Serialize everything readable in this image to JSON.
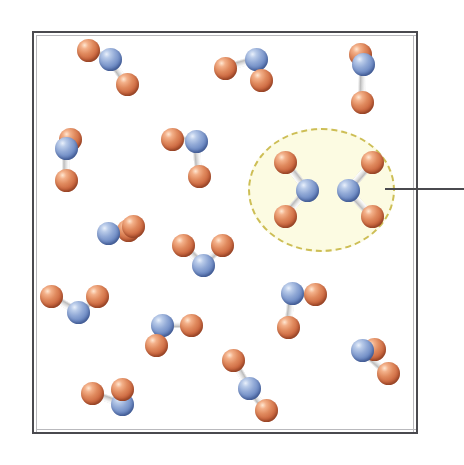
{
  "figure": {
    "kind": "molecular-diagram",
    "caption": "",
    "width": 464,
    "height": 465
  },
  "colors": {
    "background": "#ffffff",
    "container_border": "#4a4a4f",
    "container_border_shadow": "#b9b9bd",
    "container_fill": "#ffffff",
    "highlight_fill": "#fcfbe2",
    "highlight_dash": "#cdbe55",
    "callout_line": "#4a4a4f",
    "oxygen_atom": "#cd6a42",
    "nitrogen_atom": "#6e8bc4",
    "bond": "#d8d8d8"
  },
  "container": {
    "label": "gas-container",
    "x": 32,
    "y": 31,
    "width": 386,
    "height": 403,
    "border_width": 2
  },
  "highlight": {
    "label": "highlighted-collision-pair",
    "x": 248,
    "y": 128,
    "width": 147,
    "height": 124,
    "dash_width": 2
  },
  "callout": {
    "label": "callout-leader-line",
    "x": 385,
    "y": 188,
    "length": 79,
    "thickness": 2
  },
  "atom_legend": [
    {
      "element": "N",
      "name": "nitrogen",
      "color": "#6e8bc4",
      "radius": 11
    },
    {
      "element": "O",
      "name": "oxygen",
      "color": "#cd6a42",
      "radius": 11
    }
  ],
  "molecules": [
    {
      "name": "NO2",
      "id": "molecule-1",
      "region": "free-gas",
      "n": {
        "x": 110,
        "y": 59,
        "r": 11.5
      },
      "o": [
        {
          "x": 88,
          "y": 50,
          "r": 11.5
        },
        {
          "x": 127,
          "y": 84,
          "r": 11.5
        }
      ]
    },
    {
      "name": "NO2",
      "id": "molecule-2",
      "region": "free-gas",
      "n": {
        "x": 256,
        "y": 59,
        "r": 11.5
      },
      "o": [
        {
          "x": 225,
          "y": 68,
          "r": 11.5
        },
        {
          "x": 261,
          "y": 80,
          "r": 11.5
        }
      ]
    },
    {
      "name": "NO2",
      "id": "molecule-3",
      "region": "free-gas",
      "n": {
        "x": 363,
        "y": 64,
        "r": 11.5
      },
      "o": [
        {
          "x": 360,
          "y": 54,
          "r": 11.5
        },
        {
          "x": 362,
          "y": 102,
          "r": 11.5
        }
      ]
    },
    {
      "name": "NO2",
      "id": "molecule-4",
      "region": "free-gas",
      "n": {
        "x": 66,
        "y": 148,
        "r": 11.5
      },
      "o": [
        {
          "x": 70,
          "y": 139,
          "r": 11.5
        },
        {
          "x": 66,
          "y": 180,
          "r": 11.5
        }
      ]
    },
    {
      "name": "NO2",
      "id": "molecule-5",
      "region": "free-gas",
      "n": {
        "x": 196,
        "y": 141,
        "r": 11.5
      },
      "o": [
        {
          "x": 172,
          "y": 139,
          "r": 11.5
        },
        {
          "x": 199,
          "y": 176,
          "r": 11.5
        }
      ]
    },
    {
      "name": "NO2",
      "id": "molecule-6",
      "region": "highlighted",
      "n": {
        "x": 307,
        "y": 190,
        "r": 11.5
      },
      "o": [
        {
          "x": 285,
          "y": 162,
          "r": 11.5
        },
        {
          "x": 285,
          "y": 216,
          "r": 11.5
        }
      ]
    },
    {
      "name": "NO2",
      "id": "molecule-7",
      "region": "highlighted",
      "n": {
        "x": 348,
        "y": 190,
        "r": 11.5
      },
      "o": [
        {
          "x": 372,
          "y": 162,
          "r": 11.5
        },
        {
          "x": 372,
          "y": 216,
          "r": 11.5
        }
      ]
    },
    {
      "name": "NO2",
      "id": "molecule-8",
      "region": "free-gas",
      "n": {
        "x": 108,
        "y": 233,
        "r": 11.5
      },
      "o": [
        {
          "x": 128,
          "y": 230,
          "r": 11.5
        },
        {
          "x": 133,
          "y": 226,
          "r": 11.5
        }
      ]
    },
    {
      "name": "NO2",
      "id": "molecule-9",
      "region": "free-gas",
      "n": {
        "x": 203,
        "y": 265,
        "r": 11.5
      },
      "o": [
        {
          "x": 183,
          "y": 245,
          "r": 11.5
        },
        {
          "x": 222,
          "y": 245,
          "r": 11.5
        }
      ]
    },
    {
      "name": "NO2",
      "id": "molecule-10",
      "region": "free-gas",
      "n": {
        "x": 78,
        "y": 312,
        "r": 11.5
      },
      "o": [
        {
          "x": 51,
          "y": 296,
          "r": 11.5
        },
        {
          "x": 97,
          "y": 296,
          "r": 11.5
        }
      ]
    },
    {
      "name": "NO2",
      "id": "molecule-11",
      "region": "free-gas",
      "n": {
        "x": 162,
        "y": 325,
        "r": 11.5
      },
      "o": [
        {
          "x": 191,
          "y": 325,
          "r": 11.5
        },
        {
          "x": 156,
          "y": 345,
          "r": 11.5
        }
      ]
    },
    {
      "name": "NO2",
      "id": "molecule-12",
      "region": "free-gas",
      "n": {
        "x": 292,
        "y": 293,
        "r": 11.5
      },
      "o": [
        {
          "x": 315,
          "y": 294,
          "r": 11.5
        },
        {
          "x": 288,
          "y": 327,
          "r": 11.5
        }
      ]
    },
    {
      "name": "NO2",
      "id": "molecule-13",
      "region": "free-gas",
      "n": {
        "x": 362,
        "y": 350,
        "r": 11.5
      },
      "o": [
        {
          "x": 374,
          "y": 349,
          "r": 11.5
        },
        {
          "x": 388,
          "y": 373,
          "r": 11.5
        }
      ]
    },
    {
      "name": "NO2",
      "id": "molecule-14",
      "region": "free-gas",
      "n": {
        "x": 249,
        "y": 388,
        "r": 11.5
      },
      "o": [
        {
          "x": 233,
          "y": 360,
          "r": 11.5
        },
        {
          "x": 266,
          "y": 410,
          "r": 11.5
        }
      ]
    },
    {
      "name": "NO2",
      "id": "molecule-15",
      "region": "free-gas",
      "n": {
        "x": 122,
        "y": 404,
        "r": 11.5
      },
      "o": [
        {
          "x": 92,
          "y": 393,
          "r": 11.5
        },
        {
          "x": 122,
          "y": 389,
          "r": 11.5
        }
      ]
    }
  ]
}
